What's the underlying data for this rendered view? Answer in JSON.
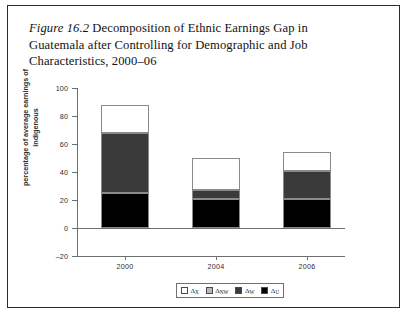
{
  "figure": {
    "label": "Figure 16.2",
    "caption": "Decomposition of Ethnic Earnings Gap in Guatemala after Controlling for Demographic and Job Characteristics, 2000–06"
  },
  "chart_data": {
    "type": "bar",
    "stacked": true,
    "title": "Decomposition of Ethnic Earnings Gap in Guatemala after Controlling for Demographic and Job Characteristics, 2000–06",
    "xlabel": "",
    "ylabel": "percentage of average earnings of indigenous",
    "categories": [
      "2000",
      "2004",
      "2006"
    ],
    "ylim": [
      -20,
      100
    ],
    "yticks": [
      -20,
      0,
      20,
      40,
      60,
      80,
      100
    ],
    "ytick_labels": [
      "–20",
      "0",
      "20",
      "40",
      "60",
      "80",
      "100"
    ],
    "grid": false,
    "legend_position": "bottom",
    "series": [
      {
        "name": "Δ_U",
        "legend_label": "Δ",
        "legend_sub": "U",
        "color": "#000000",
        "values": [
          25,
          21,
          21
        ]
      },
      {
        "name": "Δ_W",
        "legend_label": "Δ",
        "legend_sub": "W",
        "color": "#3a3a3a",
        "values": [
          43,
          6,
          20
        ]
      },
      {
        "name": "Δ_NW",
        "legend_label": "Δ",
        "legend_sub": "NW",
        "color": "#b9b9b9",
        "values": [
          0,
          0,
          0
        ]
      },
      {
        "name": "Δ_X",
        "legend_label": "Δ",
        "legend_sub": "X",
        "color": "#ffffff",
        "values": [
          20,
          23,
          13
        ]
      }
    ],
    "totals": [
      88,
      50,
      54
    ],
    "legend_order": [
      "Δ_X",
      "Δ_NW",
      "Δ_W",
      "Δ_U"
    ]
  },
  "legend": {
    "entries": [
      {
        "label": "Δ",
        "sub": "X",
        "color": "#ffffff"
      },
      {
        "label": "Δ",
        "sub": "NW",
        "color": "#b9b9b9"
      },
      {
        "label": "Δ",
        "sub": "W",
        "color": "#3a3a3a"
      },
      {
        "label": "Δ",
        "sub": "U",
        "color": "#000000"
      }
    ]
  }
}
